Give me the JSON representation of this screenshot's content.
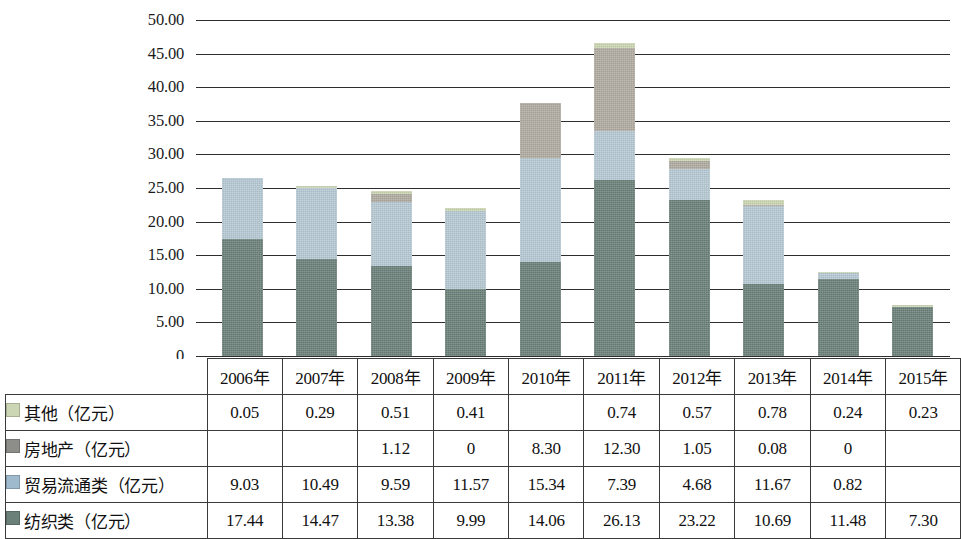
{
  "chart_data": {
    "type": "bar",
    "subtype": "stacked-column",
    "title": "",
    "xlabel": "",
    "ylabel": "",
    "ylim": [
      0,
      50
    ],
    "ytick_labels": [
      "50.00",
      "45.00",
      "40.00",
      "35.00",
      "30.00",
      "25.00",
      "20.00",
      "15.00",
      "10.00",
      "5.00",
      "0"
    ],
    "ytick_values": [
      50,
      45,
      40,
      35,
      30,
      25,
      20,
      15,
      10,
      5,
      0
    ],
    "grid": true,
    "legend_position": "table-row-labels",
    "categories": [
      "2006年",
      "2007年",
      "2008年",
      "2009年",
      "2010年",
      "2011年",
      "2012年",
      "2013年",
      "2014年",
      "2015年"
    ],
    "series": [
      {
        "name": "纺织类（亿元）",
        "color": "#6b8079",
        "stack_order": 1,
        "values": [
          17.44,
          14.47,
          13.38,
          9.99,
          14.06,
          26.13,
          23.22,
          10.69,
          11.48,
          7.3
        ],
        "display": [
          "17.44",
          "14.47",
          "13.38",
          "9.99",
          "14.06",
          "26.13",
          "23.22",
          "10.69",
          "11.48",
          "7.30"
        ]
      },
      {
        "name": "贸易流通类（亿元）",
        "color": "#b6c9d4",
        "stack_order": 2,
        "values": [
          9.03,
          10.49,
          9.59,
          11.57,
          15.34,
          7.39,
          4.68,
          11.67,
          0.82,
          null
        ],
        "display": [
          "9.03",
          "10.49",
          "9.59",
          "11.57",
          "15.34",
          "7.39",
          "4.68",
          "11.67",
          "0.82",
          ""
        ]
      },
      {
        "name": "房地产（亿元）",
        "color": "#b0aba1",
        "stack_order": 3,
        "values": [
          null,
          null,
          1.12,
          0,
          8.3,
          12.3,
          1.05,
          0.08,
          0,
          null
        ],
        "display": [
          "",
          "",
          "1.12",
          "0",
          "8.30",
          "12.30",
          "1.05",
          "0.08",
          "0",
          ""
        ]
      },
      {
        "name": "其他（亿元）",
        "color": "#ccd6b4",
        "stack_order": 4,
        "values": [
          0.05,
          0.29,
          0.51,
          0.41,
          null,
          0.74,
          0.57,
          0.78,
          0.24,
          0.23
        ],
        "display": [
          "0.05",
          "0.29",
          "0.51",
          "0.41",
          "",
          "0.74",
          "0.57",
          "0.78",
          "0.24",
          "0.23"
        ]
      }
    ],
    "totals": [
      26.52,
      25.25,
      24.6,
      21.97,
      37.7,
      46.56,
      29.52,
      23.22,
      12.54,
      7.53
    ]
  },
  "table": {
    "corner_label": "",
    "year_headers": [
      "2006年",
      "2007年",
      "2008年",
      "2009年",
      "2010年",
      "2011年",
      "2012年",
      "2013年",
      "2014年",
      "2015年"
    ],
    "rows": [
      {
        "label": "其他（亿元）",
        "swatch_color": "#ccd6b4",
        "swatch_name": "legend-swatch-other",
        "values": [
          "0.05",
          "0.29",
          "0.51",
          "0.41",
          "",
          "0.74",
          "0.57",
          "0.78",
          "0.24",
          "0.23"
        ]
      },
      {
        "label": "房地产（亿元）",
        "swatch_color": "#8d8d89",
        "swatch_name": "legend-swatch-real-estate",
        "values": [
          "",
          "",
          "1.12",
          "0",
          "8.30",
          "12.30",
          "1.05",
          "0.08",
          "0",
          ""
        ]
      },
      {
        "label": "贸易流通类（亿元）",
        "swatch_color": "#9fbacd",
        "swatch_name": "legend-swatch-trade",
        "values": [
          "9.03",
          "10.49",
          "9.59",
          "11.57",
          "15.34",
          "7.39",
          "4.68",
          "11.67",
          "0.82",
          ""
        ]
      },
      {
        "label": "纺织类（亿元）",
        "swatch_color": "#6b8079",
        "swatch_name": "legend-swatch-textile",
        "values": [
          "17.44",
          "14.47",
          "13.38",
          "9.99",
          "14.06",
          "26.13",
          "23.22",
          "10.69",
          "11.48",
          "7.30"
        ]
      }
    ]
  },
  "colors": {
    "textile": "#6b8079",
    "trade": "#b6c9d4",
    "real_estate": "#b0aba1",
    "other": "#ccd6b4",
    "axis": "#2e2e2e",
    "text": "#111111"
  }
}
